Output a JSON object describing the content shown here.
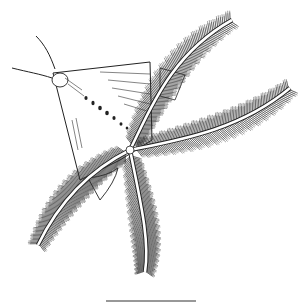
{
  "figure": {
    "background_color": "#ffffff",
    "ink_color": "#1a1a1a",
    "scale_bar": {
      "present": true,
      "label": ""
    }
  }
}
